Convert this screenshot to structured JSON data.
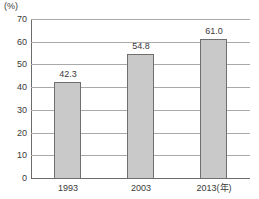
{
  "chart_data": {
    "type": "bar",
    "title": "",
    "subtitle": "",
    "xlabel": "(年)",
    "ylabel": "(%)",
    "unit_label": "(%)",
    "categories": [
      "1993",
      "2003",
      "2013"
    ],
    "category_labels": [
      "1993",
      "2003",
      "2013(年)"
    ],
    "values": [
      42.3,
      54.8,
      61.0
    ],
    "value_labels": [
      "42.3",
      "54.8",
      "61.0"
    ],
    "ylim": [
      0,
      70
    ],
    "ytick_step": 10,
    "ytick_labels": [
      "70",
      "60",
      "50",
      "40",
      "30",
      "20",
      "10",
      "0"
    ],
    "ytick_values": [
      70,
      60,
      50,
      40,
      30,
      20,
      10,
      0
    ],
    "grid": true,
    "grid_axis": "y",
    "legend": false,
    "legend_position": "none",
    "bar_fill_color": "#c9c9c9",
    "bar_border_color": "#6f6f6f",
    "gridline_color": "#a9a9a9",
    "axis_color": "#6b6b6b",
    "text_color": "#3a3a3a",
    "background_color": "#ffffff"
  }
}
